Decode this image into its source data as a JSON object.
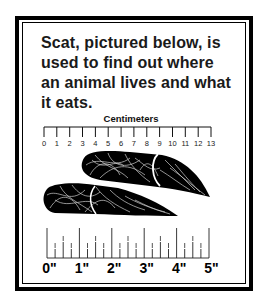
{
  "caption": {
    "lines": [
      "Scat, pictured below, is",
      "used to find out where",
      "an animal lives and what",
      "it eats."
    ]
  },
  "centimeter_ruler": {
    "title": "Centimeters",
    "labels": [
      "0",
      "1",
      "2",
      "3",
      "4",
      "5",
      "6",
      "7",
      "8",
      "9",
      "10",
      "11",
      "12",
      "13"
    ]
  },
  "inch_ruler": {
    "labels": [
      "0\"",
      "1\"",
      "2\"",
      "3\"",
      "4\"",
      "5\""
    ],
    "fraction_labels": [
      "1/4",
      "1/2",
      "3/4"
    ]
  },
  "illustration": {
    "subject": "scat",
    "pieces": 2
  },
  "colors": {
    "ink": "#000000",
    "background": "#ffffff"
  }
}
